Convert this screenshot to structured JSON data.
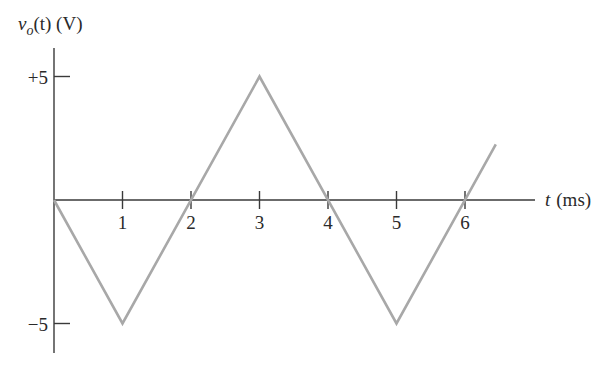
{
  "chart_data": {
    "type": "line",
    "title": "",
    "ylabel": "v_o(t) (V)",
    "ylabel_parts": {
      "var": "v",
      "sub": "o",
      "rest": "(t) (V)"
    },
    "xlabel": "t (ms)",
    "xlabel_parts": {
      "var": "t",
      "rest": "(ms)"
    },
    "x_ticks": [
      1,
      2,
      3,
      4,
      5,
      6
    ],
    "y_ticks": [
      5,
      -5
    ],
    "y_tick_labels": [
      "+5",
      "−5"
    ],
    "xlim": [
      0,
      6.9
    ],
    "ylim": [
      -6,
      6.3
    ],
    "grid": false,
    "legend": null,
    "series": [
      {
        "name": "v_o(t)",
        "color": "#a8a8a8",
        "x": [
          0,
          1,
          3,
          5,
          6.45
        ],
        "y": [
          0,
          -5,
          5,
          -5,
          2.25
        ]
      }
    ]
  }
}
